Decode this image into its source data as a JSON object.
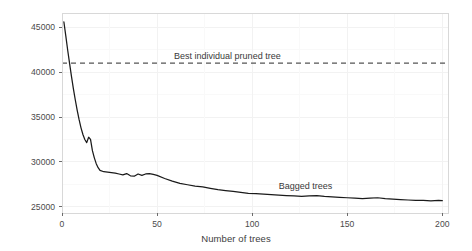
{
  "chart_data": {
    "type": "line",
    "title": "",
    "xlabel": "Number of trees",
    "ylabel": "RMSE",
    "xlim": [
      0,
      203
    ],
    "ylim": [
      24300,
      46600
    ],
    "grid": true,
    "legend_position": "inline-annotations",
    "xticks": [
      0,
      50,
      100,
      150,
      200
    ],
    "xtick_labels": [
      "0",
      "50",
      "100",
      "150",
      "200"
    ],
    "yticks": [
      25000,
      30000,
      35000,
      40000,
      45000
    ],
    "ytick_labels": [
      "25000",
      "30000",
      "35000",
      "40000",
      "45000"
    ],
    "annotations": [
      {
        "name": "best-individual-pruned-tree-label",
        "text": "Best individual pruned tree",
        "x": 60,
        "y": 41700
      },
      {
        "name": "bagged-trees-label",
        "text": "Bagged trees",
        "x": 115,
        "y": 27200
      }
    ],
    "series": [
      {
        "name": "Bagged trees",
        "style": "solid",
        "color": "#1a1a1a",
        "x": [
          1,
          2,
          3,
          4,
          5,
          6,
          7,
          8,
          9,
          10,
          11,
          12,
          13,
          14,
          15,
          16,
          17,
          18,
          19,
          20,
          22,
          24,
          26,
          28,
          30,
          32,
          34,
          36,
          38,
          40,
          42,
          44,
          46,
          48,
          50,
          54,
          58,
          62,
          66,
          70,
          74,
          78,
          82,
          86,
          90,
          94,
          98,
          102,
          106,
          110,
          114,
          118,
          122,
          126,
          130,
          134,
          138,
          142,
          146,
          150,
          154,
          158,
          162,
          166,
          170,
          174,
          178,
          182,
          186,
          190,
          194,
          198,
          200
        ],
        "y": [
          45600,
          44050,
          42450,
          40950,
          39500,
          38150,
          36900,
          35750,
          34700,
          33800,
          33050,
          32500,
          32150,
          32750,
          32500,
          31250,
          30450,
          29800,
          29350,
          29050,
          28900,
          28850,
          28800,
          28750,
          28650,
          28550,
          28700,
          28450,
          28400,
          28650,
          28500,
          28650,
          28700,
          28600,
          28500,
          28150,
          27850,
          27600,
          27450,
          27300,
          27200,
          27050,
          26900,
          26800,
          26700,
          26600,
          26500,
          26450,
          26400,
          26350,
          26300,
          26250,
          26200,
          26150,
          26200,
          26250,
          26150,
          26100,
          26050,
          26000,
          25950,
          25900,
          25950,
          26000,
          25900,
          25850,
          25800,
          25750,
          25700,
          25700,
          25650,
          25700,
          25680
        ]
      },
      {
        "name": "Best individual pruned tree",
        "style": "dashed",
        "color": "#555555",
        "constant_y": 41000
      }
    ]
  },
  "panel": {
    "background": "#ffffff",
    "border_color": "#d9d9d9",
    "gridline_color": "#fbfbfb"
  }
}
